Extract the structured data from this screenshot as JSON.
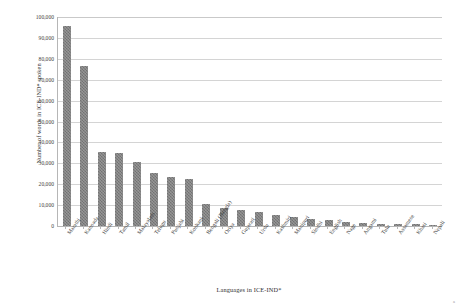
{
  "chart_data": {
    "type": "bar",
    "title": "",
    "xlabel": "Languages in ICE-IND*",
    "ylabel": "Number of words in ICE-IND* spoken",
    "ylim": [
      0,
      100000
    ],
    "ytick_values": [
      0,
      10000,
      20000,
      30000,
      40000,
      50000,
      60000,
      70000,
      80000,
      90000,
      100000
    ],
    "ytick_labels": [
      "0",
      "10,000",
      "20,000",
      "30,000",
      "40,000",
      "50,000",
      "60,000",
      "70,000",
      "80,000",
      "90,000",
      "100,000"
    ],
    "grid": true,
    "legend": "none",
    "bar_color": "#7f7f7f",
    "categories": [
      "Marathi",
      "Kannada",
      "Hindi",
      "Tamil",
      "Malayalam",
      "Telugu",
      "Punjabi",
      "Konkani",
      "Bengali (Bangla)",
      "Oriya",
      "Gujarati",
      "Urdu",
      "Kashmiri",
      "Manipuri",
      "Sindhi",
      "English",
      "Nage",
      "Angami",
      "Tulu",
      "Assamese",
      "Khasi",
      "Nepali"
    ],
    "values": [
      95500,
      76500,
      35500,
      35000,
      30500,
      25500,
      23500,
      22500,
      10500,
      8500,
      7500,
      6500,
      5500,
      4500,
      3500,
      3000,
      1800,
      1500,
      1200,
      1000,
      800,
      600
    ]
  },
  "corner": {
    "mark": "a"
  }
}
